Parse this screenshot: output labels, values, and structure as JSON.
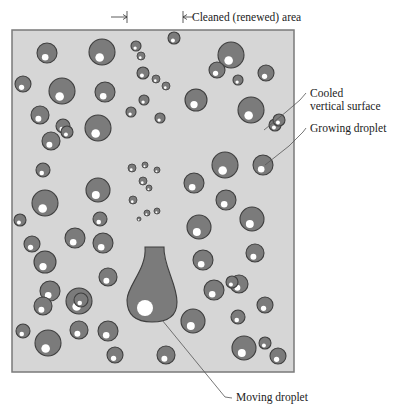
{
  "diagram": {
    "type": "dropwise-condensation-illustration",
    "colors": {
      "surface_fill": "#d6d6d6",
      "surface_border": "#7a7a7a",
      "droplet_fill": "#7b7b7b",
      "droplet_border": "#3f3f3f",
      "highlight": "#ffffff",
      "leader_line": "#555555",
      "text": "#222222"
    },
    "surface": {
      "x": 12,
      "y": 30,
      "width": 282,
      "height": 342
    },
    "labels": {
      "cleaned_area": "Cleaned (renewed) area",
      "cooled_surface_line1": "Cooled",
      "cooled_surface_line2": "vertical surface",
      "growing_droplet": "Growing droplet",
      "moving_droplet": "Moving droplet"
    },
    "cleaned_area_markers": {
      "left_x": 127,
      "right_x": 183,
      "y": 17
    },
    "droplets": [
      [
        47,
        53,
        10
      ],
      [
        102,
        52,
        13
      ],
      [
        136,
        46,
        5
      ],
      [
        174,
        38,
        6
      ],
      [
        23,
        84,
        8
      ],
      [
        62,
        91,
        13
      ],
      [
        105,
        92,
        10
      ],
      [
        141,
        56,
        4
      ],
      [
        143,
        73,
        6
      ],
      [
        144,
        100,
        5
      ],
      [
        40,
        115,
        9
      ],
      [
        63,
        126,
        7
      ],
      [
        67,
        132,
        6
      ],
      [
        51,
        141,
        9
      ],
      [
        98,
        128,
        13
      ],
      [
        131,
        112,
        5
      ],
      [
        156,
        79,
        4
      ],
      [
        166,
        86,
        4
      ],
      [
        160,
        118,
        5
      ],
      [
        231,
        55,
        13
      ],
      [
        266,
        73,
        8
      ],
      [
        238,
        80,
        5
      ],
      [
        251,
        110,
        13
      ],
      [
        275,
        125,
        6
      ],
      [
        196,
        100,
        11
      ],
      [
        217,
        70,
        8
      ],
      [
        279,
        120,
        6
      ],
      [
        20,
        220,
        6
      ],
      [
        45,
        203,
        13
      ],
      [
        75,
        238,
        10
      ],
      [
        103,
        243,
        10
      ],
      [
        43,
        170,
        7
      ],
      [
        45,
        262,
        11
      ],
      [
        100,
        219,
        7
      ],
      [
        98,
        190,
        12
      ],
      [
        132,
        168,
        4
      ],
      [
        145,
        165,
        3
      ],
      [
        157,
        170,
        3
      ],
      [
        143,
        181,
        4
      ],
      [
        133,
        200,
        4
      ],
      [
        149,
        188,
        3
      ],
      [
        157,
        211,
        3
      ],
      [
        147,
        213,
        3
      ],
      [
        139,
        219,
        2
      ],
      [
        194,
        183,
        10
      ],
      [
        225,
        165,
        13
      ],
      [
        263,
        165,
        10
      ],
      [
        226,
        200,
        10
      ],
      [
        199,
        227,
        12
      ],
      [
        252,
        219,
        12
      ],
      [
        255,
        253,
        9
      ],
      [
        239,
        284,
        9
      ],
      [
        265,
        305,
        8
      ],
      [
        203,
        260,
        10
      ],
      [
        32,
        244,
        8
      ],
      [
        50,
        291,
        10
      ],
      [
        79,
        301,
        13
      ],
      [
        108,
        277,
        9
      ],
      [
        43,
        306,
        9
      ],
      [
        79,
        330,
        9
      ],
      [
        108,
        331,
        10
      ],
      [
        48,
        343,
        13
      ],
      [
        81,
        300,
        7
      ],
      [
        193,
        321,
        12
      ],
      [
        166,
        355,
        9
      ],
      [
        238,
        317,
        7
      ],
      [
        244,
        348,
        12
      ],
      [
        278,
        356,
        8
      ],
      [
        214,
        290,
        10
      ],
      [
        232,
        282,
        6
      ],
      [
        115,
        355,
        8
      ],
      [
        23,
        331,
        7
      ],
      [
        265,
        343,
        6
      ]
    ],
    "moving_droplet": {
      "neck_top_y": 247,
      "neck_left_x": 145,
      "neck_right_x": 164,
      "bulb_center_x": 152,
      "bulb_center_y": 300,
      "bulb_radius_x": 25,
      "bulb_radius_y": 22,
      "highlight_x": 145,
      "highlight_y": 308,
      "highlight_r": 8
    },
    "leaders": {
      "cooled": [
        [
          264,
          130
        ],
        [
          286,
          112
        ],
        [
          300,
          100
        ],
        [
          306,
          93
        ]
      ],
      "growing": [
        [
          265,
          165
        ],
        [
          289,
          146
        ],
        [
          303,
          132
        ],
        [
          306,
          128
        ]
      ],
      "moving": [
        [
          162,
          320
        ],
        [
          225,
          397
        ],
        [
          232,
          398
        ]
      ]
    }
  }
}
